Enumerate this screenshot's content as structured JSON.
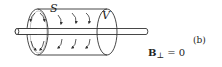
{
  "diagram": {
    "labels": {
      "surface": "S",
      "volume": "V",
      "panel": "(b)",
      "field_symbol": "B",
      "field_subscript": "⊥",
      "field_equation_rhs": "= 0"
    },
    "elements": {
      "cylinder": "gaussian cylinder enclosing wire",
      "rod": "straight wire through cylinder axis",
      "end_cap_arrows": "circular field arrows on end cap",
      "side_arrows": "arrows along curved surface"
    },
    "colors": {
      "stroke": "#333333",
      "background": "#ffffff"
    }
  }
}
